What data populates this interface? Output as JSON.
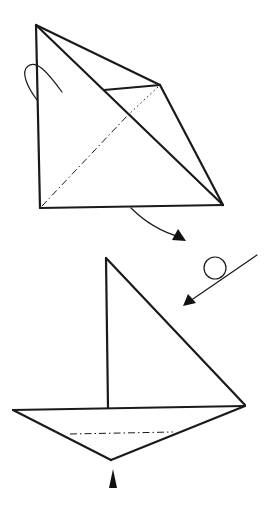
{
  "diagram": {
    "type": "origami-instruction",
    "colors": {
      "line": "#1a1a1a",
      "background": "#ffffff"
    },
    "steps": [
      {
        "name": "step-folded-square",
        "description": "Square folded along diagonal with flap, valley-fold line shown dash-dot",
        "symbols": [
          "turn-over-loop-arrow",
          "curved-move-arrow",
          "valley-fold-line"
        ]
      },
      {
        "name": "step-sailboat",
        "description": "Sailboat shape: triangular sail above a hull, with a dash-dot fold line across the hull",
        "symbols": [
          "turn-over-arrow-with-circle",
          "push-arrow-up",
          "valley-fold-line"
        ]
      }
    ],
    "labels": []
  }
}
